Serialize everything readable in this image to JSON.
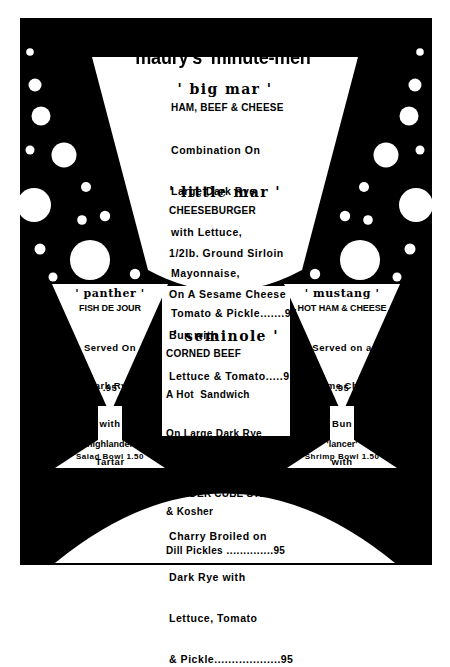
{
  "advert": {
    "headline": "maury's 'minute-men'",
    "shape_motif": "martini-glass",
    "colors": {
      "ink": "#000000",
      "paper": "#ffffff"
    }
  },
  "items": {
    "big_mar": {
      "name": "' big mar '",
      "subtitle": "HAM, BEEF & CHEESE",
      "lines": [
        "Combination On",
        "Large Dark Rye",
        "with Lettuce,",
        "Mayonnaise,",
        "Tomato & Pickle"
      ],
      "leader": ".......",
      "price": "95"
    },
    "little_mar": {
      "name": "' little mar '",
      "subtitle": "CHEESEBURGER",
      "lines": [
        "1/2lb. Ground Sirloin",
        "On A Sesame Cheese",
        "Bun with",
        "Lettuce & Tomato"
      ],
      "leader": ".....",
      "price": "95"
    },
    "panther": {
      "name": "' panther '",
      "subtitle": "FISH DE JOUR",
      "lines": [
        "Served On",
        "Dark Rye",
        "with",
        "Tartar",
        "Sauce"
      ],
      "price": ".95"
    },
    "mustang": {
      "name": "' mustang '",
      "subtitle": "HOT HAM & CHEESE",
      "lines": [
        "Served on a",
        "Sesame Cheese",
        "Bun",
        "with",
        "Pickle"
      ],
      "price": ".95"
    },
    "seminole": {
      "name": "' seminole '",
      "subtitle": "CORNED BEEF",
      "lines": [
        "A Hot  Sandwich",
        "On Large Dark Rye",
        "with Raw Sauer Kraut",
        "& Kosher",
        "Dill Pickles"
      ],
      "leader": " .............",
      "price": ".95"
    },
    "redskin": {
      "name": "' redskin '",
      "subtitle": "TENDER CUBE STEAK",
      "lines": [
        "Charry Broiled on",
        "Dark Rye with",
        "Lettuce, Tomato",
        "& Pickle"
      ],
      "leader": "..................",
      "price": ".95"
    },
    "highlander": {
      "name": "'highlander'",
      "detail": "Salad Bowl 1.50"
    },
    "lancer": {
      "name": "'lancer'",
      "detail": "Shrimp Bowl 1.50"
    }
  }
}
